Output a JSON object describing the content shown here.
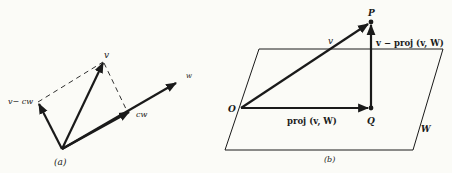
{
  "figure_a": {
    "caption": "(a)",
    "labels": {
      "v": "v",
      "v_minus_cw": "v− cw",
      "cw": "cw",
      "w": "w"
    }
  },
  "figure_b": {
    "caption": "(b)",
    "labels": {
      "P": "P",
      "O": "O",
      "Q": "Q",
      "v": "v",
      "v_minus_proj": "v − proj (v, W)",
      "proj": "proj (v, W)",
      "plane": "W"
    }
  },
  "colors": {
    "background": "#fbfbf7",
    "ink": "#1a1a1a"
  }
}
